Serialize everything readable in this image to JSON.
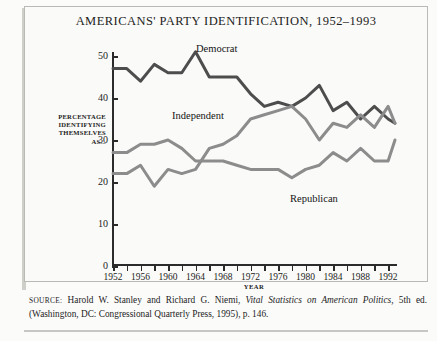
{
  "figure": {
    "title": "AMERICANS' PARTY IDENTIFICATION, 1952–1993",
    "source_label": "SOURCE:",
    "source_text_1": " Harold W. Stanley and Richard G. Niemi, ",
    "source_italic": "Vital Statistics on American Politics,",
    "source_text_2": " 5th ed. (Washington, DC: Congressional Quarterly Press, 1995), p. 146."
  },
  "axes": {
    "ylabel_line1": "PERCENTAGE",
    "ylabel_line2": "IDENTIFYING",
    "ylabel_line3": "THEMSELVES",
    "ylabel_line4": "AS...",
    "xlabel": "YEAR",
    "yticks": [
      "0",
      "10",
      "20",
      "30",
      "40",
      "50"
    ],
    "xticks": [
      "1952",
      "1956",
      "1960",
      "1964",
      "1968",
      "1972",
      "1976",
      "1980",
      "1984",
      "1988",
      "1992"
    ]
  },
  "labels": {
    "democrat": "Democrat",
    "independent": "Independent",
    "republican": "Republican"
  },
  "colors": {
    "democrat": "#4d4d4d",
    "independent": "#8c8c8c",
    "republican": "#8c8c8c",
    "axis": "#2b2b2b",
    "page_background": "#fbfbfa",
    "panel_background": "#fafaf8",
    "border": "#b9b9b6"
  },
  "chart_data": {
    "type": "line",
    "title": "AMERICANS' PARTY IDENTIFICATION, 1952–1993",
    "xlabel": "YEAR",
    "ylabel": "PERCENTAGE IDENTIFYING THEMSELVES AS...",
    "xlim": [
      1952,
      1993
    ],
    "ylim": [
      0,
      52
    ],
    "grid": false,
    "legend": "inline-labels",
    "x": [
      1952,
      1954,
      1956,
      1958,
      1960,
      1962,
      1964,
      1966,
      1968,
      1970,
      1972,
      1974,
      1976,
      1978,
      1980,
      1982,
      1984,
      1986,
      1988,
      1990,
      1992,
      1993
    ],
    "series": [
      {
        "name": "Democrat",
        "color": "#4d4d4d",
        "values": [
          47,
          47,
          44,
          48,
          46,
          46,
          51,
          45,
          45,
          45,
          41,
          38,
          39,
          38,
          40,
          43,
          37,
          39,
          35,
          38,
          35,
          34
        ]
      },
      {
        "name": "Independent",
        "color": "#8c8c8c",
        "values": [
          22,
          22,
          24,
          19,
          23,
          22,
          23,
          28,
          29,
          31,
          35,
          36,
          37,
          38,
          35,
          30,
          34,
          33,
          36,
          33,
          38,
          34
        ]
      },
      {
        "name": "Republican",
        "color": "#8c8c8c",
        "values": [
          27,
          27,
          29,
          29,
          30,
          28,
          25,
          25,
          25,
          24,
          23,
          23,
          23,
          21,
          23,
          24,
          27,
          25,
          28,
          25,
          25,
          30
        ]
      }
    ]
  }
}
